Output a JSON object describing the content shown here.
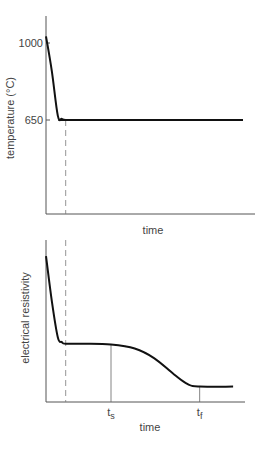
{
  "chart_data": [
    {
      "type": "line",
      "title": "",
      "xlabel": "time",
      "ylabel": "temperature (°C)",
      "yticks": [
        1000,
        650
      ],
      "ylim": [
        400,
        1090
      ],
      "xlim": [
        0,
        10
      ],
      "dashed_marker_x": 1,
      "series": [
        {
          "name": "temperature",
          "x": [
            0,
            0.3,
            0.6,
            0.8,
            1.0,
            1.5,
            10
          ],
          "y": [
            1030,
            870,
            670,
            655,
            650,
            650,
            650
          ]
        }
      ]
    },
    {
      "type": "line",
      "title": "",
      "xlabel": "time",
      "ylabel": "electrical resistivity",
      "xticks": [
        {
          "label": "t",
          "sub": "s",
          "x": 3.3
        },
        {
          "label": "t",
          "sub": "f",
          "x": 7.8
        }
      ],
      "ylim": [
        0,
        1
      ],
      "xlim": [
        0,
        10
      ],
      "dashed_marker_x": 1,
      "series": [
        {
          "name": "electrical resistivity",
          "x": [
            0,
            0.3,
            0.6,
            0.8,
            1.0,
            2.0,
            3.3,
            4.5,
            5.5,
            6.5,
            7.2,
            7.8,
            9.5
          ],
          "y": [
            0.9,
            0.62,
            0.4,
            0.37,
            0.36,
            0.36,
            0.355,
            0.33,
            0.27,
            0.17,
            0.11,
            0.095,
            0.095
          ]
        }
      ]
    }
  ]
}
